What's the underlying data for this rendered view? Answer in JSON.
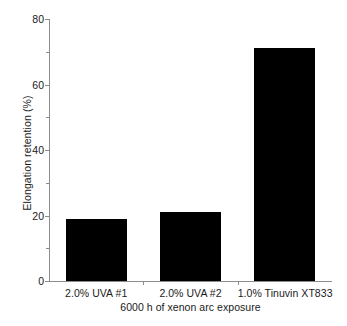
{
  "chart_data": {
    "type": "bar",
    "title": "",
    "subtitle": "",
    "categories": [
      "2.0% UVA #1",
      "2.0% UVA #2",
      "1.0% Tinuvin XT833"
    ],
    "values": [
      19,
      21,
      71
    ],
    "xlabel": "6000 h of xenon arc exposure",
    "ylabel": "Elongation retention (%)",
    "ylim": [
      0,
      80
    ],
    "ytick_labels": [
      "0",
      "20",
      "40",
      "60",
      "80"
    ],
    "ytick_values": [
      0,
      20,
      40,
      60,
      80
    ],
    "yminor_tick_values": [
      10,
      30,
      50,
      70
    ],
    "grid": false,
    "legend": false,
    "legend_position": "none",
    "bar_color": "#000000",
    "axis_color": "#8c8c8c",
    "background_color": "#ffffff"
  }
}
